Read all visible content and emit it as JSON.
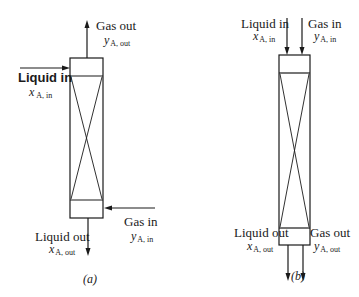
{
  "diagram_a": {
    "caption": "(a)",
    "arrangement": "countercurrent",
    "top_outlet": {
      "label": "Gas out",
      "var": "y",
      "sub": "A, out"
    },
    "top_inlet": {
      "label": "Liquid in",
      "var": "x",
      "sub": "A, in"
    },
    "bottom_inlet": {
      "label": "Gas in",
      "var": "y",
      "sub": "A, in"
    },
    "bottom_outlet": {
      "label": "Liquid out",
      "var": "x",
      "sub": "A, out"
    }
  },
  "diagram_b": {
    "caption": "(b)",
    "arrangement": "cocurrent",
    "top_inlet_liquid": {
      "label": "Liquid in",
      "var": "x",
      "sub": "A, in"
    },
    "top_inlet_gas": {
      "label": "Gas in",
      "var": "y",
      "sub": "A, in"
    },
    "bottom_outlet_liquid": {
      "label": "Liquid out",
      "var": "x",
      "sub": "A, out"
    },
    "bottom_outlet_gas": {
      "label": "Gas out",
      "var": "y",
      "sub": "A, out"
    }
  }
}
